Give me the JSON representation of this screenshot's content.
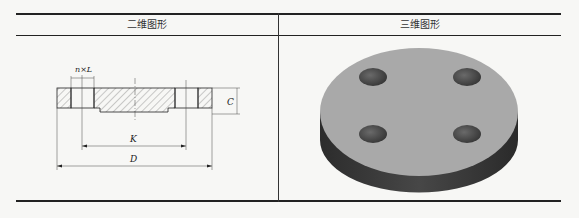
{
  "table": {
    "headers": [
      "二维图形",
      "三维图形"
    ]
  },
  "drawing_2d": {
    "labels": {
      "holes": "n×L",
      "thickness": "C",
      "bolt_circle": "K",
      "outer_diameter": "D"
    }
  },
  "drawing_3d": {
    "description": "Isometric blind flange with 4 bolt holes",
    "hole_count": 4,
    "colors": {
      "top": "#a9a9a9",
      "side": "#3a3a3a"
    }
  }
}
